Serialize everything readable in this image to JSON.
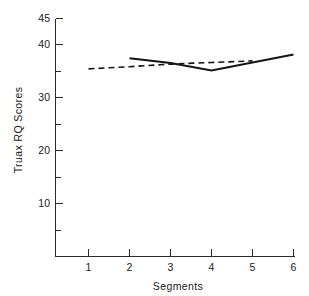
{
  "chart_data": {
    "type": "line",
    "title": "",
    "xlabel": "Segments",
    "ylabel": "Truax RQ Scores",
    "x": [
      1,
      2,
      3,
      4,
      5,
      6
    ],
    "xticklabels": [
      "1",
      "2",
      "3",
      "4",
      "5",
      "6"
    ],
    "xlim": [
      0.55,
      6.2
    ],
    "ylim": [
      0,
      45
    ],
    "yticks": [
      5,
      10,
      15,
      20,
      25,
      30,
      35,
      40,
      45
    ],
    "yticklabels_major": [
      "10",
      "20",
      "30",
      "40",
      "45"
    ],
    "ymajor": [
      10,
      20,
      30,
      40,
      45
    ],
    "yminor": [
      5,
      15,
      25,
      35
    ],
    "grid": false,
    "legend": "none",
    "series": [
      {
        "name": "dashed-series",
        "style": "dashed",
        "x": [
          1,
          2,
          3,
          4,
          5
        ],
        "values": [
          35.5,
          35.9,
          36.4,
          36.7,
          37.0
        ]
      },
      {
        "name": "solid-series",
        "style": "solid",
        "x": [
          2,
          3,
          4,
          6
        ],
        "values": [
          37.5,
          36.6,
          35.2,
          38.2
        ]
      }
    ]
  },
  "axes": {
    "y_title": "Truax RQ Scores",
    "x_title": "Segments",
    "y_labels": {
      "t45": "45",
      "t40": "40",
      "t30": "30",
      "t20": "20",
      "t10": "10"
    },
    "x_labels": {
      "s1": "1",
      "s2": "2",
      "s3": "3",
      "s4": "4",
      "s5": "5",
      "s6": "6"
    }
  },
  "colors": {
    "ink": "#141414",
    "axis": "#2b2b2b",
    "background": "#ffffff"
  }
}
